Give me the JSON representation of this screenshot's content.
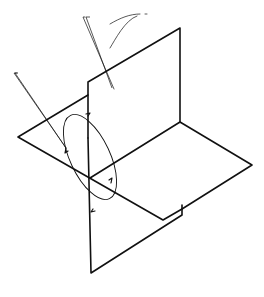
{
  "diagram": {
    "labels": {
      "vertical_plane": "Vertical plane",
      "second_angle": "Second angle",
      "first_angle": "First angle",
      "third_angle": "Third angle",
      "horizontal_plane_line1": "Horizontal",
      "horizontal_plane_line2": "plane",
      "fourth_angle": "Fourth angle"
    },
    "colors": {
      "line": "#111111",
      "background": "#ffffff"
    }
  }
}
